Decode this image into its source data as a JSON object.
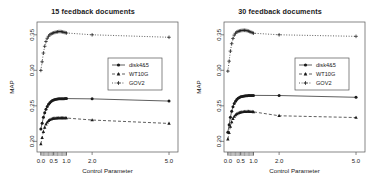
{
  "figure": {
    "axis_label_x": "Control Parameter",
    "axis_label_y": "MAP"
  },
  "chart_data": [
    {
      "type": "line",
      "title": "15 feedback documents",
      "xlabel": "Control Parameter",
      "ylabel": "MAP",
      "xlim": [
        -0.15,
        5.35
      ],
      "ylim": [
        0.185,
        0.368
      ],
      "xticks": [
        "0.0",
        "0.5",
        "1.0",
        "2.0",
        "5.0"
      ],
      "xtick_values": [
        0.0,
        0.5,
        1.0,
        2.0,
        5.0
      ],
      "yticks": [
        "0.20",
        "0.25",
        "0.30",
        "0.35"
      ],
      "ytick_values": [
        0.2,
        0.25,
        0.3,
        0.35
      ],
      "grid": false,
      "legend_position": "center-right",
      "x": [
        0.0,
        0.05,
        0.1,
        0.15,
        0.2,
        0.25,
        0.3,
        0.35,
        0.4,
        0.45,
        0.5,
        0.55,
        0.6,
        0.65,
        0.7,
        0.75,
        0.8,
        0.85,
        0.9,
        0.95,
        1.0,
        2.0,
        5.0
      ],
      "series": [
        {
          "name": "disk4&5",
          "marker": "filled-circle",
          "linestyle": "solid",
          "values": [
            0.2175,
            0.2255,
            0.2338,
            0.2402,
            0.2452,
            0.2492,
            0.2522,
            0.2545,
            0.2562,
            0.2574,
            0.2583,
            0.2589,
            0.2593,
            0.2596,
            0.2598,
            0.2599,
            0.26,
            0.2601,
            0.2601,
            0.2602,
            0.2602,
            0.2598,
            0.2567
          ]
        },
        {
          "name": "WT10G",
          "marker": "filled-triangle",
          "linestyle": "dashed",
          "values": [
            0.1962,
            0.2052,
            0.2135,
            0.2196,
            0.224,
            0.227,
            0.229,
            0.2303,
            0.2312,
            0.2318,
            0.2322,
            0.2325,
            0.2327,
            0.2328,
            0.2329,
            0.233,
            0.233,
            0.233,
            0.2329,
            0.2329,
            0.2328,
            0.23,
            0.2252
          ]
        },
        {
          "name": "GOV2",
          "marker": "plus",
          "linestyle": "dotted",
          "values": [
            0.2998,
            0.312,
            0.3243,
            0.3338,
            0.3405,
            0.345,
            0.348,
            0.35,
            0.3513,
            0.3521,
            0.3528,
            0.3533,
            0.3538,
            0.3542,
            0.3545,
            0.3546,
            0.3544,
            0.354,
            0.3535,
            0.353,
            0.3525,
            0.35,
            0.3465
          ]
        }
      ]
    },
    {
      "type": "line",
      "title": "30 feedback documents",
      "xlabel": "Control Parameter",
      "ylabel": "MAP",
      "xlim": [
        -0.15,
        5.35
      ],
      "ylim": [
        0.185,
        0.368
      ],
      "xticks": [
        "0.0",
        "0.5",
        "1.0",
        "2.0",
        "5.0"
      ],
      "xtick_values": [
        0.0,
        0.5,
        1.0,
        2.0,
        5.0
      ],
      "yticks": [
        "0.20",
        "0.25",
        "0.30",
        "0.35"
      ],
      "ytick_values": [
        0.2,
        0.25,
        0.3,
        0.35
      ],
      "grid": false,
      "legend_position": "center-right",
      "x": [
        0.0,
        0.05,
        0.1,
        0.15,
        0.2,
        0.25,
        0.3,
        0.35,
        0.4,
        0.45,
        0.5,
        0.55,
        0.6,
        0.65,
        0.7,
        0.75,
        0.8,
        0.85,
        0.9,
        0.95,
        1.0,
        2.0,
        5.0
      ],
      "series": [
        {
          "name": "disk4&5",
          "marker": "filled-circle",
          "linestyle": "solid",
          "values": [
            0.2128,
            0.2232,
            0.234,
            0.2424,
            0.2487,
            0.2533,
            0.2566,
            0.259,
            0.2607,
            0.2618,
            0.2626,
            0.2632,
            0.2636,
            0.2639,
            0.2641,
            0.2643,
            0.2644,
            0.2645,
            0.2646,
            0.2646,
            0.2647,
            0.2645,
            0.262
          ]
        },
        {
          "name": "WT10G",
          "marker": "filled-triangle",
          "linestyle": "dashed",
          "values": [
            0.203,
            0.212,
            0.2208,
            0.2272,
            0.2318,
            0.235,
            0.2372,
            0.2387,
            0.2397,
            0.2404,
            0.2409,
            0.2413,
            0.2416,
            0.2418,
            0.2419,
            0.242,
            0.242,
            0.2419,
            0.2418,
            0.2417,
            0.2415,
            0.236,
            0.2335
          ]
        },
        {
          "name": "GOV2",
          "marker": "plus",
          "linestyle": "dotted",
          "values": [
            0.2988,
            0.3128,
            0.327,
            0.3375,
            0.3448,
            0.3495,
            0.3522,
            0.3538,
            0.3548,
            0.3554,
            0.3558,
            0.3561,
            0.3563,
            0.3563,
            0.3562,
            0.3558,
            0.3552,
            0.3545,
            0.3538,
            0.353,
            0.3522,
            0.35,
            0.3478
          ]
        }
      ]
    }
  ]
}
